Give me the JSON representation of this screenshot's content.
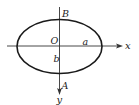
{
  "diagram": {
    "type": "ellipse-with-axes",
    "colors": {
      "stroke": "#1a1a1a",
      "axis": "#333333",
      "text": "#222222",
      "background": "#ffffff"
    },
    "axes": {
      "x_label": "x",
      "y_label": "y",
      "y_direction": "down"
    },
    "labels": {
      "origin": "O",
      "top_point": "B",
      "bottom_point": "A",
      "semi_major": "a",
      "semi_minor": "b"
    }
  }
}
